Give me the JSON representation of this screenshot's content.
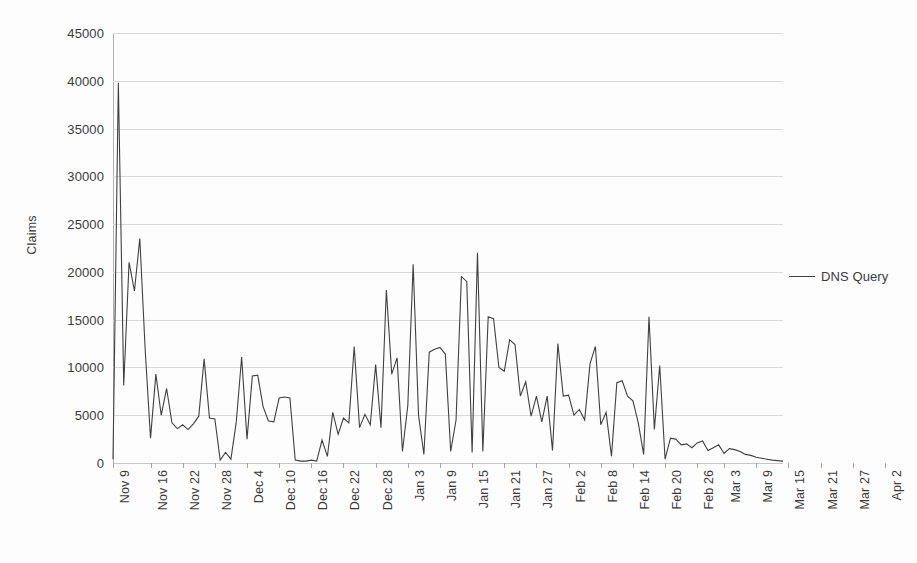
{
  "chart_data": {
    "type": "line",
    "title": "",
    "xlabel": "",
    "ylabel": "Claims",
    "ylim": [
      0,
      45000
    ],
    "y_ticks": [
      0,
      5000,
      10000,
      15000,
      20000,
      25000,
      30000,
      35000,
      40000,
      45000
    ],
    "y_tick_labels": [
      "0",
      "5000",
      "10000",
      "15000",
      "20000",
      "25000",
      "30000",
      "35000",
      "40000",
      "45000"
    ],
    "grid": true,
    "legend_position": "right",
    "legend": [
      "DNS Query"
    ],
    "line_color": "#404040",
    "grid_color": "#d9d9d9",
    "background_color": "#fdfdfd",
    "x_tick_labels": [
      "Nov 9",
      "Nov 16",
      "Nov 22",
      "Nov 28",
      "Dec 4",
      "Dec 10",
      "Dec 16",
      "Dec 22",
      "Dec 28",
      "Jan 3",
      "Jan 9",
      "Jan 15",
      "Jan 21",
      "Jan 27",
      "Feb 2",
      "Feb 8",
      "Feb 14",
      "Feb 20",
      "Feb 26",
      "Mar 3",
      "Mar 9",
      "Mar 15",
      "Mar 21",
      "Mar 27",
      "Apr 2",
      "Apr 8"
    ],
    "x_tick_indices": [
      0,
      7,
      13,
      19,
      25,
      31,
      37,
      43,
      49,
      55,
      61,
      67,
      73,
      79,
      85,
      91,
      97,
      103,
      109,
      114,
      120,
      126,
      132,
      138,
      144,
      150
    ],
    "series": [
      {
        "name": "DNS Query",
        "values": [
          400,
          39800,
          8100,
          21000,
          18000,
          23500,
          11900,
          2600,
          9300,
          5000,
          7800,
          4200,
          3600,
          4000,
          3500,
          4100,
          4900,
          10900,
          4700,
          4600,
          300,
          1100,
          400,
          4300,
          11100,
          2500,
          9100,
          9200,
          5900,
          4400,
          4300,
          6800,
          6900,
          6800,
          300,
          200,
          200,
          300,
          200,
          2400,
          700,
          5300,
          3000,
          4700,
          4200,
          12200,
          3700,
          5100,
          4000,
          10300,
          3700,
          18100,
          9300,
          11000,
          1200,
          6000,
          20800,
          5000,
          900,
          11600,
          11900,
          12100,
          11400,
          1200,
          4500,
          19500,
          19000,
          1100,
          22000,
          1200,
          15300,
          15100,
          10000,
          9600,
          12900,
          12400,
          7000,
          8500,
          4900,
          7000,
          4300,
          7000,
          1300,
          12500,
          7000,
          7100,
          5000,
          5600,
          4500,
          10400,
          12200,
          4000,
          5300,
          700,
          8400,
          8600,
          7000,
          6500,
          4200,
          900,
          15300,
          3500,
          10200,
          400,
          2600,
          2500,
          1900,
          2000,
          1600,
          2100,
          2300,
          1300,
          1600,
          1900,
          1000,
          1500,
          1400,
          1200,
          900,
          800,
          600,
          500,
          400,
          300,
          250,
          200
        ]
      }
    ]
  }
}
